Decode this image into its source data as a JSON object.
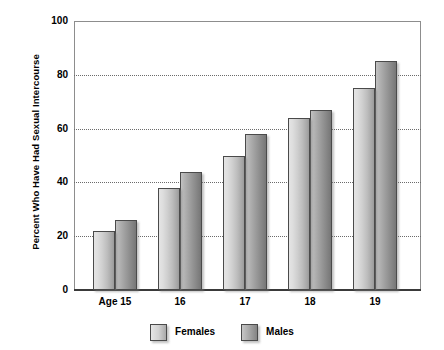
{
  "chart_data": {
    "type": "bar",
    "title": "",
    "subtitle": "",
    "xlabel": "",
    "ylabel": "Percent Who Have Had Sexual Intercourse",
    "categories": [
      "Age 15",
      "16",
      "17",
      "18",
      "19"
    ],
    "series": [
      {
        "name": "Females",
        "values": [
          22,
          38,
          50,
          64,
          75
        ],
        "color": "#d2d2d2"
      },
      {
        "name": "Males",
        "values": [
          26,
          44,
          58,
          67,
          85
        ],
        "color": "#8f8f8f"
      }
    ],
    "ylim": [
      0,
      100
    ],
    "y_ticks": [
      0,
      20,
      40,
      60,
      80,
      100
    ],
    "y_tick_labels": [
      "0",
      "20",
      "40",
      "60",
      "80",
      "100"
    ],
    "grid": "horizontal-dotted",
    "legend_position": "bottom-center",
    "annotations": []
  },
  "axes": {
    "y_title": "Percent Who Have Had Sexual Intercourse",
    "y_labels": [
      "100",
      "80",
      "60",
      "40",
      "20",
      "0"
    ],
    "x_labels": [
      "Age 15",
      "16",
      "17",
      "18",
      "19"
    ]
  },
  "legend": {
    "items": [
      {
        "label": "Females",
        "swatch": "female-swatch"
      },
      {
        "label": "Males",
        "swatch": "male-swatch"
      }
    ]
  },
  "colors": {
    "female_light": "#e4e4e4",
    "female_dark": "#9b9b9b",
    "male_light": "#c2c2c2",
    "male_dark": "#767676",
    "outline": "#4a4a4a",
    "gridline": "#6b6b6b",
    "frame": "#8d8d8d",
    "background": "#ffffff"
  }
}
